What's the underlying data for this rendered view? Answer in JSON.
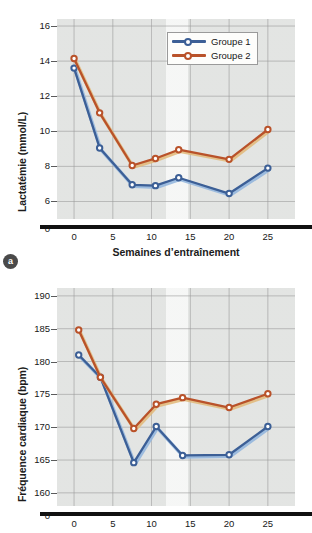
{
  "figure": {
    "panel_a_badge": "a",
    "legend": {
      "position": "top-right",
      "items": [
        {
          "label": "Groupe 1",
          "color": "#3c5f96"
        },
        {
          "label": "Groupe 2",
          "color": "#b9522a"
        }
      ]
    }
  },
  "chart_data": [
    {
      "id": "panel-a",
      "type": "line",
      "title": "",
      "xlabel": "Semaines d’entraînement",
      "ylabel": "Lactatémie (mmol/L)",
      "xlim": [
        -2.2,
        28.5
      ],
      "ylim": [
        5.0,
        16.4
      ],
      "xticks": [
        "0",
        "5",
        "10",
        "15",
        "20",
        "25"
      ],
      "xtick_values": [
        0,
        5,
        10,
        15,
        20,
        25
      ],
      "yticks": [
        "16",
        "14",
        "12",
        "10",
        "8",
        "6",
        "0"
      ],
      "ytick_values": [
        16,
        14,
        12,
        10,
        8,
        6
      ],
      "axis_break_tick": "0",
      "grid": true,
      "x": [
        0,
        3.3,
        7.5,
        10.5,
        13.5,
        20.0,
        25.0
      ],
      "series": [
        {
          "name": "Groupe 1",
          "color": "#3c5f96",
          "values": [
            13.6,
            9.05,
            6.95,
            6.9,
            7.35,
            6.45,
            7.9
          ]
        },
        {
          "name": "Groupe 2",
          "color": "#b9522a",
          "values": [
            14.15,
            11.05,
            8.05,
            8.45,
            8.95,
            8.4,
            10.1
          ]
        }
      ]
    },
    {
      "id": "panel-b",
      "type": "line",
      "title": "",
      "xlabel": "",
      "ylabel": "Fréquence cardiaque (bpm)",
      "xlim": [
        -2.2,
        28.5
      ],
      "ylim": [
        158.0,
        191.2
      ],
      "xticks": [
        "0",
        "5",
        "10",
        "15",
        "20",
        "25"
      ],
      "xtick_values": [
        0,
        5,
        10,
        15,
        20,
        25
      ],
      "yticks": [
        "190",
        "185",
        "180",
        "175",
        "170",
        "165",
        "160",
        "0"
      ],
      "ytick_values": [
        190,
        185,
        180,
        175,
        170,
        165,
        160
      ],
      "axis_break_tick": "0",
      "grid": true,
      "x": [
        0.6,
        3.4,
        7.7,
        10.6,
        14.0,
        20.0,
        25.0
      ],
      "series": [
        {
          "name": "Groupe 1",
          "color": "#3c5f96",
          "values": [
            181.0,
            177.6,
            164.6,
            170.1,
            165.7,
            165.8,
            170.1
          ]
        },
        {
          "name": "Groupe 2",
          "color": "#b9522a",
          "values": [
            184.8,
            177.6,
            169.8,
            173.5,
            174.5,
            173.0,
            175.1
          ]
        }
      ]
    }
  ]
}
